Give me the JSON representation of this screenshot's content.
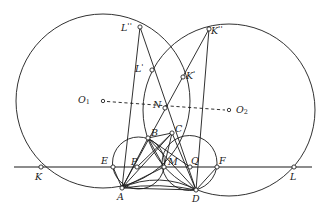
{
  "figure": {
    "canvas": {
      "width": 324,
      "height": 221
    },
    "stroke_color": "#1a1a1a",
    "background": "#ffffff",
    "marker_fill": "#ffffff",
    "stroke_width": 0.9
  },
  "circles": [
    {
      "name": "big-circle-left",
      "cx": 103,
      "cy": 101,
      "r": 87,
      "dashed": false
    },
    {
      "name": "big-circle-right",
      "cx": 229,
      "cy": 110,
      "r": 86,
      "dashed": false
    },
    {
      "name": "small-circle-left",
      "cx": 138.5,
      "cy": 163,
      "r": 26,
      "dashed": false
    },
    {
      "name": "small-circle-right",
      "cx": 189.5,
      "cy": 163,
      "r": 27.5,
      "dashed": false
    }
  ],
  "baseline": {
    "name": "baseline-KL",
    "x1": 14,
    "y1": 167,
    "x2": 312,
    "y2": 167
  },
  "center_line": {
    "name": "center-line-O1O2",
    "x1": 107,
    "y1": 101.5,
    "x2": 225,
    "y2": 110,
    "dashed": true
  },
  "points": [
    {
      "id": "O1",
      "label": "O",
      "sub": "1",
      "prime": "",
      "x": 103,
      "y": 101,
      "lx": 78,
      "ly": 95,
      "marker": true
    },
    {
      "id": "O2",
      "label": "O",
      "sub": "2",
      "prime": "",
      "x": 229,
      "y": 110,
      "lx": 236,
      "ly": 105,
      "marker": true
    },
    {
      "id": "K",
      "label": "K",
      "sub": "",
      "prime": "",
      "x": 41,
      "y": 167,
      "lx": 35,
      "ly": 172,
      "marker": true
    },
    {
      "id": "L",
      "label": "L",
      "sub": "",
      "prime": "",
      "x": 294,
      "y": 167,
      "lx": 290,
      "ly": 172,
      "marker": true
    },
    {
      "id": "E",
      "label": "E",
      "sub": "",
      "prime": "",
      "x": 113,
      "y": 167,
      "lx": 101,
      "ly": 156,
      "marker": true
    },
    {
      "id": "F",
      "label": "F",
      "sub": "",
      "prime": "",
      "x": 217,
      "y": 167,
      "lx": 219,
      "ly": 156,
      "marker": true
    },
    {
      "id": "P",
      "label": "P",
      "sub": "",
      "prime": "",
      "x": 137,
      "y": 167,
      "lx": 131,
      "ly": 157,
      "marker": true
    },
    {
      "id": "Q",
      "label": "Q",
      "sub": "",
      "prime": "",
      "x": 190,
      "y": 167,
      "lx": 191,
      "ly": 156,
      "marker": true
    },
    {
      "id": "M",
      "label": "M",
      "sub": "",
      "prime": "",
      "x": 164,
      "y": 167,
      "lx": 168,
      "ly": 157,
      "marker": true
    },
    {
      "id": "N",
      "label": "N",
      "sub": "",
      "prime": "",
      "x": 165,
      "y": 108,
      "lx": 153,
      "ly": 100,
      "marker": true
    },
    {
      "id": "A",
      "label": "A",
      "sub": "",
      "prime": "",
      "x": 122,
      "y": 188,
      "lx": 117,
      "ly": 192,
      "marker": true
    },
    {
      "id": "B",
      "label": "B",
      "sub": "",
      "prime": "",
      "x": 148,
      "y": 138,
      "lx": 151,
      "ly": 128,
      "marker": true
    },
    {
      "id": "C",
      "label": "C",
      "sub": "",
      "prime": "",
      "x": 172,
      "y": 133,
      "lx": 175,
      "ly": 124,
      "marker": true
    },
    {
      "id": "D",
      "label": "D",
      "sub": "",
      "prime": "",
      "x": 196,
      "y": 190,
      "lx": 192,
      "ly": 194,
      "marker": true
    },
    {
      "id": "Lp",
      "label": "L",
      "sub": "",
      "prime": "'",
      "x": 152,
      "y": 70,
      "lx": 135,
      "ly": 63,
      "marker": true
    },
    {
      "id": "Kp",
      "label": "K",
      "sub": "",
      "prime": "'",
      "x": 183,
      "y": 77,
      "lx": 186,
      "ly": 70,
      "marker": true
    },
    {
      "id": "Lpp",
      "label": "L",
      "sub": "",
      "prime": "''",
      "x": 140,
      "y": 27,
      "lx": 121,
      "ly": 22,
      "marker": true
    },
    {
      "id": "Kpp",
      "label": "K",
      "sub": "",
      "prime": "''",
      "x": 209,
      "y": 29,
      "lx": 211,
      "ly": 25,
      "marker": true
    }
  ],
  "segments": [
    {
      "name": "segment-Lpp-A",
      "x1": 140,
      "y1": 27,
      "x2": 122,
      "y2": 188
    },
    {
      "name": "segment-Lpp-D",
      "x1": 140,
      "y1": 27,
      "x2": 196,
      "y2": 190
    },
    {
      "name": "segment-Kpp-A",
      "x1": 209,
      "y1": 29,
      "x2": 122,
      "y2": 188
    },
    {
      "name": "segment-Kpp-D",
      "x1": 209,
      "y1": 29,
      "x2": 196,
      "y2": 190
    },
    {
      "name": "segment-A-B",
      "x1": 122,
      "y1": 188,
      "x2": 148,
      "y2": 138
    },
    {
      "name": "segment-A-C",
      "x1": 122,
      "y1": 188,
      "x2": 172,
      "y2": 133
    },
    {
      "name": "segment-A-D",
      "x1": 122,
      "y1": 188,
      "x2": 196,
      "y2": 190
    },
    {
      "name": "segment-A-M",
      "x1": 122,
      "y1": 188,
      "x2": 164,
      "y2": 167
    },
    {
      "name": "segment-B-D",
      "x1": 148,
      "y1": 138,
      "x2": 196,
      "y2": 190
    },
    {
      "name": "segment-C-D",
      "x1": 172,
      "y1": 133,
      "x2": 196,
      "y2": 190
    },
    {
      "name": "segment-B-C",
      "x1": 148,
      "y1": 138,
      "x2": 172,
      "y2": 133
    },
    {
      "name": "segment-B-M",
      "x1": 148,
      "y1": 138,
      "x2": 164,
      "y2": 167
    },
    {
      "name": "segment-C-M",
      "x1": 172,
      "y1": 133,
      "x2": 164,
      "y2": 167
    },
    {
      "name": "segment-P-C",
      "x1": 137,
      "y1": 167,
      "x2": 172,
      "y2": 133
    },
    {
      "name": "segment-Q-B",
      "x1": 190,
      "y1": 167,
      "x2": 148,
      "y2": 138
    },
    {
      "name": "segment-E-A",
      "x1": 113,
      "y1": 167,
      "x2": 122,
      "y2": 188
    },
    {
      "name": "segment-F-D",
      "x1": 217,
      "y1": 167,
      "x2": 196,
      "y2": 190
    }
  ],
  "arcs": [
    {
      "name": "arc-lens-A-D-upper",
      "x1": 122,
      "y1": 188,
      "x2": 196,
      "y2": 190,
      "rx": 60,
      "ry": 42,
      "sweep": 1
    },
    {
      "name": "arc-lens-A-D-lower",
      "x1": 122,
      "y1": 188,
      "x2": 196,
      "y2": 190,
      "rx": 75,
      "ry": 25,
      "sweep": 1
    }
  ]
}
